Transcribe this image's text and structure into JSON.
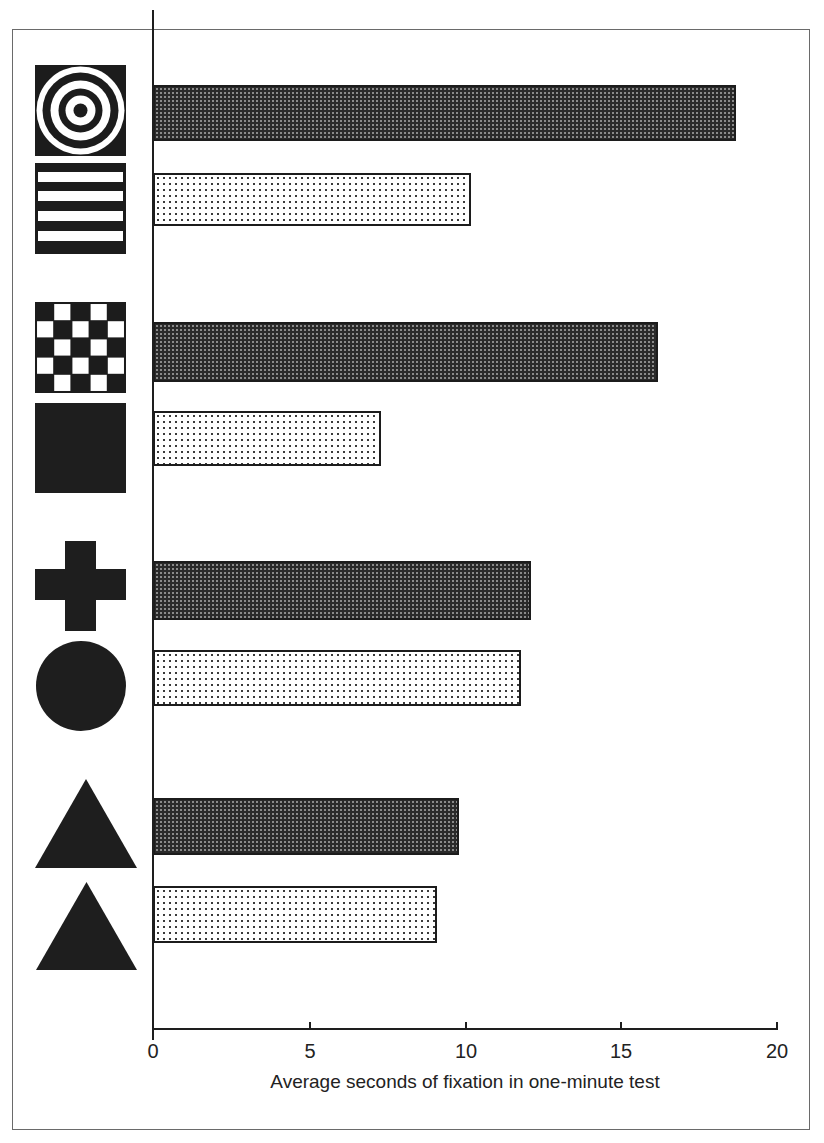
{
  "chart_data": {
    "type": "bar",
    "orientation": "horizontal",
    "title": "",
    "xlabel": "Average seconds of fixation in one-minute test",
    "ylabel": "",
    "xlim": [
      0,
      20
    ],
    "x_ticks": [
      "0",
      "5",
      "10",
      "15",
      "20"
    ],
    "grid": false,
    "legend": null,
    "categories": [
      "bullseye (concentric circles)",
      "horizontal stripes",
      "checkerboard",
      "solid black square",
      "cross",
      "solid black circle",
      "triangle",
      "triangle"
    ],
    "bar_styles": [
      "dark",
      "light",
      "dark",
      "light",
      "dark",
      "light",
      "dark",
      "light"
    ],
    "values": [
      18.7,
      10.2,
      16.2,
      7.3,
      12.1,
      11.8,
      9.8,
      9.1
    ],
    "pairs": [
      {
        "patterned": "bullseye",
        "plain": "horizontal stripes",
        "values": [
          18.7,
          10.2
        ]
      },
      {
        "patterned": "checkerboard",
        "plain": "solid black square",
        "values": [
          16.2,
          7.3
        ]
      },
      {
        "patterned": "cross",
        "plain": "solid black circle",
        "values": [
          12.1,
          11.8
        ]
      },
      {
        "patterned": "triangle",
        "plain": "triangle",
        "values": [
          9.8,
          9.1
        ]
      }
    ]
  },
  "axis": {
    "ticks": [
      "0",
      "5",
      "10",
      "15",
      "20"
    ],
    "title": "Average seconds of fixation in one-minute test"
  },
  "colors": {
    "dark_bar": "#2a2a2a",
    "light_bar": "#ffffff",
    "ink": "#1c1c1c"
  }
}
